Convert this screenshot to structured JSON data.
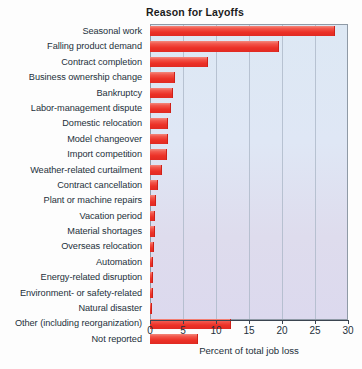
{
  "chart_data": {
    "type": "bar",
    "orientation": "horizontal",
    "title": "Reason for Layoffs",
    "xlabel": "Percent of total job loss",
    "ylabel": "",
    "xlim": [
      0,
      30
    ],
    "xticks": [
      0,
      5,
      10,
      15,
      20,
      25,
      30
    ],
    "xtick_labels": [
      "0",
      "5",
      "10",
      "15",
      "20",
      "25",
      "30"
    ],
    "grid": "vertical",
    "legend": "none",
    "bar_color": "#ec3127",
    "plot_background": "#dde8f4",
    "categories": [
      "Seasonal work",
      "Falling product demand",
      "Contract completion",
      "Business ownership change",
      "Bankruptcy",
      "Labor-management dispute",
      "Domestic relocation",
      "Model changeover",
      "Import competition",
      "Weather-related curtailment",
      "Contract cancellation",
      "Plant or machine repairs",
      "Vacation period",
      "Material shortages",
      "Overseas relocation",
      "Automation",
      "Energy-related disruption",
      "Environment- or safety-related",
      "Natural disaster",
      "Other (including reorganization)",
      "Not reported"
    ],
    "values": [
      28.0,
      19.5,
      8.8,
      3.8,
      3.5,
      3.2,
      2.7,
      2.7,
      2.6,
      1.8,
      1.2,
      0.9,
      0.8,
      0.7,
      0.6,
      0.5,
      0.4,
      0.4,
      0.3,
      12.2,
      7.3
    ]
  }
}
